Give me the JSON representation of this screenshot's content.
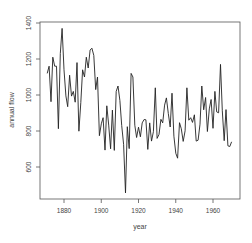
{
  "chart_data": {
    "type": "line",
    "title": "",
    "xlabel": "year",
    "ylabel": "annual flow",
    "xlim": [
      1871,
      1970
    ],
    "ylim": [
      456,
      1370
    ],
    "x_ticks": [
      "1880",
      "1900",
      "1920",
      "1940",
      "1960"
    ],
    "y_ticks": [
      "600",
      "800",
      "1000",
      "1200",
      "1400"
    ],
    "grid": false,
    "x_start": 1871,
    "values": [
      1120,
      1160,
      963,
      1210,
      1160,
      1160,
      813,
      1230,
      1370,
      1140,
      995,
      935,
      1110,
      994,
      1020,
      960,
      1180,
      799,
      958,
      1140,
      1100,
      1210,
      1150,
      1250,
      1260,
      1220,
      1030,
      1100,
      774,
      840,
      874,
      694,
      940,
      833,
      701,
      916,
      692,
      1020,
      1050,
      969,
      831,
      726,
      456,
      824,
      702,
      1120,
      1100,
      832,
      764,
      821,
      768,
      845,
      864,
      862,
      698,
      845,
      744,
      796,
      1040,
      759,
      781,
      865,
      845,
      944,
      984,
      897,
      822,
      1010,
      771,
      676,
      649,
      846,
      812,
      742,
      801,
      1040,
      860,
      874,
      848,
      890,
      744,
      749,
      838,
      1050,
      918,
      986,
      797,
      923,
      975,
      815,
      1020,
      906,
      901,
      1170,
      912,
      746,
      919,
      718,
      714,
      740
    ]
  }
}
